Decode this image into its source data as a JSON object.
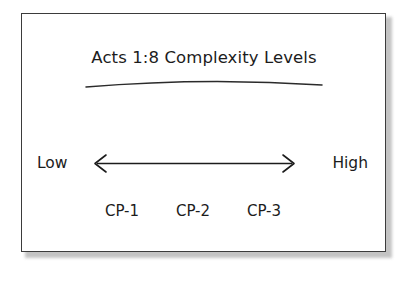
{
  "diagram": {
    "title": "Acts 1:8 Complexity Levels",
    "scale": {
      "left_label": "Low",
      "right_label": "High",
      "arrow_name": "double-headed-arrow"
    },
    "levels": [
      {
        "label": "CP-1"
      },
      {
        "label": "CP-2"
      },
      {
        "label": "CP-3"
      }
    ],
    "colors": {
      "ink": "#1c1c1c",
      "frame": "#3b3b3b",
      "shadow": "#b9b9b9",
      "background": "#ffffff"
    }
  }
}
